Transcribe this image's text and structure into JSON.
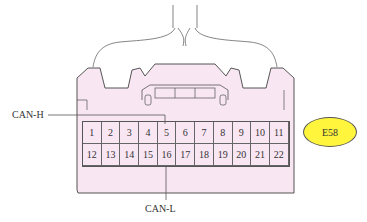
{
  "connector": {
    "id": "E58",
    "badge_color": "#fff53d",
    "body_color": "#f8e6f3",
    "pins_row1": [
      "1",
      "2",
      "3",
      "4",
      "5",
      "6",
      "7",
      "8",
      "9",
      "10",
      "11"
    ],
    "pins_row2": [
      "12",
      "13",
      "14",
      "15",
      "16",
      "17",
      "18",
      "19",
      "20",
      "21",
      "22"
    ]
  },
  "labels": {
    "can_h": "CAN-H",
    "can_l": "CAN-L"
  },
  "annotations": [
    {
      "label": "CAN-H",
      "pin": "5"
    },
    {
      "label": "CAN-L",
      "pin": "16"
    }
  ]
}
